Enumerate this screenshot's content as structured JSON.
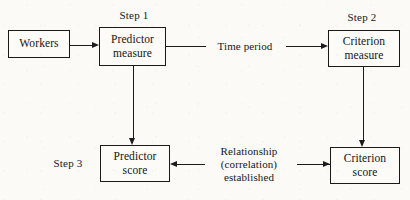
{
  "diagram": {
    "background_color": "#fbfaf7",
    "ink_color": "#1a1a1a",
    "boxes": [
      {
        "id": "workers",
        "label": "Workers"
      },
      {
        "id": "predictor-measure",
        "label": "Predictor\nmeasure"
      },
      {
        "id": "criterion-measure",
        "label": "Criterion\nmeasure"
      },
      {
        "id": "predictor-score",
        "label": "Predictor\nscore"
      },
      {
        "id": "criterion-score",
        "label": "Criterion\nscore"
      }
    ],
    "step_labels": [
      {
        "id": "step-1",
        "text": "Step 1"
      },
      {
        "id": "step-2",
        "text": "Step 2"
      },
      {
        "id": "step-3",
        "text": "Step 3"
      }
    ],
    "edge_labels": [
      {
        "id": "time-period",
        "text": "Time period"
      },
      {
        "id": "relationship",
        "text": "Relationship\n(correlation)\nestablished"
      }
    ]
  }
}
